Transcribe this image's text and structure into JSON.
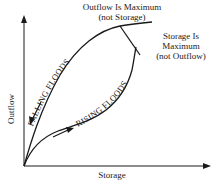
{
  "diagram": {
    "type": "storage-outflow hysteresis loop",
    "axes": {
      "x_label": "Storage",
      "y_label": "Outflow"
    },
    "annotations": {
      "outflow_max_line1": "Outflow Is Maximum",
      "outflow_max_line2": "(not Storage)",
      "storage_max_line1": "Storage Is",
      "storage_max_line2": "Maximum",
      "storage_max_line3": "(not Outflow)"
    },
    "curves": {
      "falling": "FALLING FLOODS",
      "rising": "RISING FLOODS"
    },
    "colors": {
      "ink": "#1a1a1a",
      "background": "#ffffff"
    }
  }
}
